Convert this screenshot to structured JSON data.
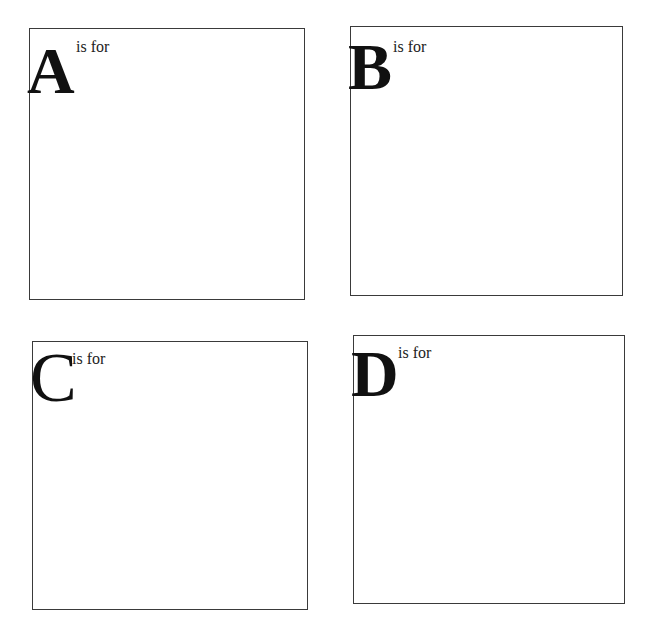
{
  "header": {
    "cutoff_text": "                                    "
  },
  "cards": [
    {
      "letter": "A",
      "caption": "is for",
      "answer": ""
    },
    {
      "letter": "B",
      "caption": "is for",
      "answer": ""
    },
    {
      "letter": "C",
      "caption": "is for",
      "answer": ""
    },
    {
      "letter": "D",
      "caption": "is for",
      "answer": ""
    }
  ],
  "colors": {
    "border": "#3a3a3a",
    "letter": "#111111",
    "background": "#ffffff"
  }
}
